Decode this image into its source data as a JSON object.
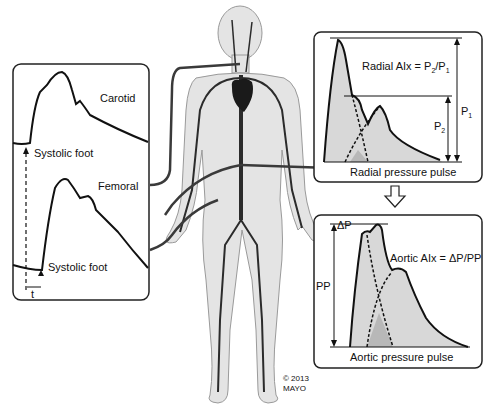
{
  "left_panel": {
    "carotid_label": "Carotid",
    "femoral_label": "Femoral",
    "systolic_foot_top": "Systolic foot",
    "systolic_foot_bottom": "Systolic foot",
    "time_label": "t"
  },
  "radial_panel": {
    "formula_prefix": "Radial AIx = P",
    "formula_sub1": "2",
    "formula_mid": "/P",
    "formula_sub2": "1",
    "p1_label": "P",
    "p1_sub": "1",
    "p2_label": "P",
    "p2_sub": "2",
    "caption": "Radial pressure pulse"
  },
  "aortic_panel": {
    "formula": "Aortic AIx = ΔP/PP",
    "delta_p_label": "ΔP",
    "pp_label": "PP",
    "caption": "Aortic pressure pulse"
  },
  "arrow": {
    "icon": "down-arrow-outline-icon"
  },
  "copyright": {
    "line1": "© 2013",
    "line2": "MAYO"
  },
  "colors": {
    "fill_light": "#d9d9d9",
    "fill_overlap": "#b8b8b8",
    "body": "#e2e2e2",
    "vessel": "#2a2a2a"
  }
}
